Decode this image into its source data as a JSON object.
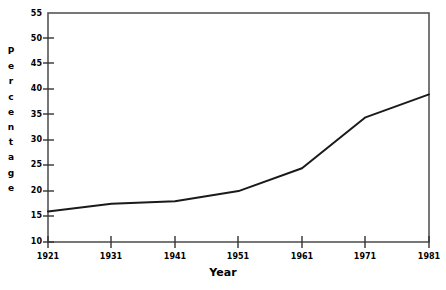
{
  "chart_data": {
    "type": "line",
    "title": "",
    "xlabel": "Year",
    "ylabel": "Percentage",
    "ylabel_letters": [
      "P",
      "e",
      "r",
      "c",
      "e",
      "n",
      "t",
      "a",
      "g",
      "e"
    ],
    "x": [
      1921,
      1931,
      1941,
      1951,
      1961,
      1971,
      1981
    ],
    "values": [
      16.0,
      17.5,
      18.0,
      20.0,
      24.5,
      34.5,
      39.0
    ],
    "series": [
      {
        "name": "Percentage",
        "values": [
          16.0,
          17.5,
          18.0,
          20.0,
          24.5,
          34.5,
          39.0
        ]
      }
    ],
    "xlim": [
      1921,
      1981
    ],
    "ylim": [
      10,
      55
    ],
    "xticks": [
      "1921",
      "1931",
      "1941",
      "1951",
      "1961",
      "1971",
      "1981"
    ],
    "yticks": [
      "10",
      "15",
      "20",
      "25",
      "30",
      "35",
      "40",
      "45",
      "50",
      "55"
    ],
    "grid": false,
    "legend": "none",
    "line_color": "#1a1a1a",
    "axis_color": "#555555",
    "background": "#ffffff"
  }
}
